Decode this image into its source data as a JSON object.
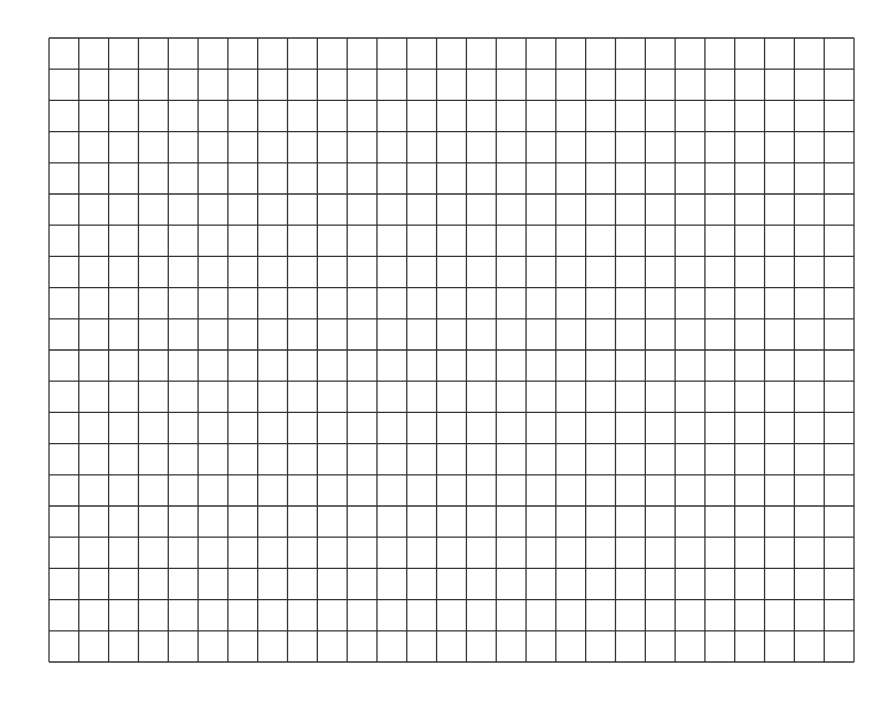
{
  "page": {
    "background": "#ffffff"
  },
  "grid": {
    "columns": 27,
    "rows": 20,
    "line_color": "#333333",
    "line_width": 1.3,
    "left": 48,
    "top": 37,
    "width": 805,
    "height": 624
  }
}
